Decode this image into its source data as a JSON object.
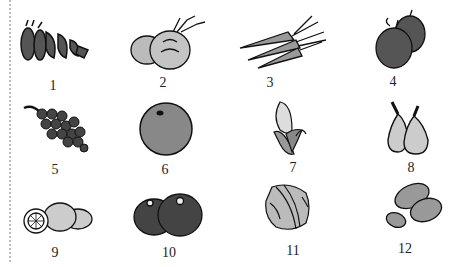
{
  "items": [
    {
      "number": "1",
      "icon": "pea-pods-icon"
    },
    {
      "number": "2",
      "icon": "onions-icon"
    },
    {
      "number": "3",
      "icon": "carrots-icon"
    },
    {
      "number": "4",
      "icon": "apples-icon"
    },
    {
      "number": "5",
      "icon": "grapes-icon"
    },
    {
      "number": "6",
      "icon": "orange-icon"
    },
    {
      "number": "7",
      "icon": "corn-icon"
    },
    {
      "number": "8",
      "icon": "pears-icon"
    },
    {
      "number": "9",
      "icon": "lemons-icon"
    },
    {
      "number": "10",
      "icon": "tomatoes-icon"
    },
    {
      "number": "11",
      "icon": "cabbage-icon"
    },
    {
      "number": "12",
      "icon": "potatoes-icon"
    }
  ]
}
